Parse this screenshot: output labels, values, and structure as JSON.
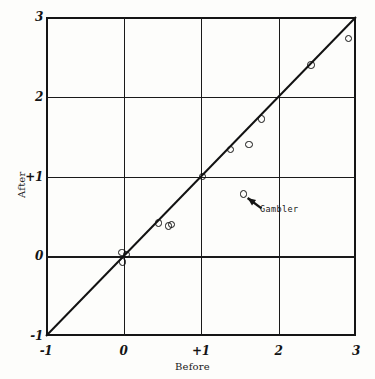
{
  "chart_data": {
    "type": "scatter",
    "title": "",
    "xlabel": "Before",
    "ylabel": "After",
    "xlim": [
      -1,
      3
    ],
    "ylim": [
      -1,
      3
    ],
    "xticks": [
      -1,
      0,
      1,
      2,
      3
    ],
    "yticks": [
      -1,
      0,
      1,
      2,
      3
    ],
    "xticklabels": [
      "-1",
      "0",
      "+1",
      "2",
      "3"
    ],
    "yticklabels": [
      "-1",
      "0",
      "+1",
      "2",
      "3"
    ],
    "grid": true,
    "legend": null,
    "reference_line": {
      "name": "identity-line",
      "equation": "y = x",
      "from": [
        -1,
        -1
      ],
      "to": [
        3,
        3
      ]
    },
    "points": [
      {
        "x": -0.02,
        "y": 0.05
      },
      {
        "x": -0.01,
        "y": -0.07
      },
      {
        "x": 0.04,
        "y": 0.02
      },
      {
        "x": 0.45,
        "y": 0.42
      },
      {
        "x": 0.58,
        "y": 0.38
      },
      {
        "x": 0.62,
        "y": 0.4
      },
      {
        "x": 1.02,
        "y": 1.0
      },
      {
        "x": 1.38,
        "y": 1.34
      },
      {
        "x": 1.55,
        "y": 0.78
      },
      {
        "x": 1.62,
        "y": 1.4
      },
      {
        "x": 1.78,
        "y": 1.72
      },
      {
        "x": 2.42,
        "y": 2.4
      },
      {
        "x": 2.9,
        "y": 2.73
      }
    ],
    "annotations": [
      {
        "label": "Gambler",
        "points_to": {
          "x": 1.55,
          "y": 0.78
        },
        "text_at": {
          "x": 1.78,
          "y": 0.6
        }
      }
    ],
    "colors": {
      "ink": "#141414",
      "background": "#fdfdfb",
      "marker_edge": "#121212",
      "gridline": "#1a1a1a"
    }
  }
}
